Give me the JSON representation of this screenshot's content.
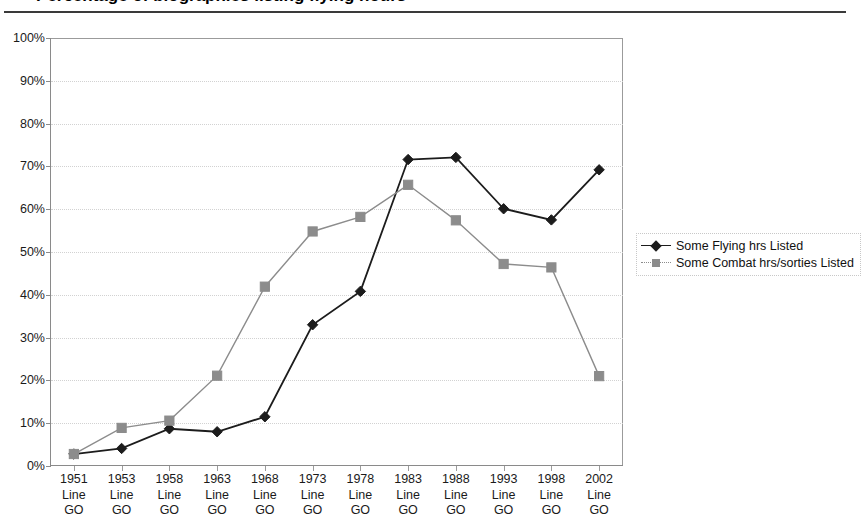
{
  "page": {
    "title_fragment": "Percentage of biographies listing flying hours",
    "background": "#ffffff"
  },
  "legend": {
    "position": "right",
    "items": [
      {
        "label": "Some Flying hrs Listed",
        "color": "#1c1c1c",
        "marker": "diamond"
      },
      {
        "label": "Some Combat hrs/sorties Listed",
        "color": "#8c8c8c",
        "marker": "square"
      }
    ]
  },
  "axis": {
    "y_ticks": [
      "0%",
      "10%",
      "20%",
      "30%",
      "40%",
      "50%",
      "60%",
      "70%",
      "80%",
      "90%",
      "100%"
    ],
    "x_sublabels": [
      "Line",
      "GO"
    ]
  },
  "chart_data": {
    "type": "line",
    "title": "Percentage of biographies listing flying hours",
    "xlabel": "",
    "ylabel": "",
    "ylim": [
      0,
      100
    ],
    "yticks": [
      0,
      10,
      20,
      30,
      40,
      50,
      60,
      70,
      80,
      90,
      100
    ],
    "ytick_labels": [
      "0%",
      "10%",
      "20%",
      "30%",
      "40%",
      "50%",
      "60%",
      "70%",
      "80%",
      "90%",
      "100%"
    ],
    "grid": true,
    "legend_position": "right",
    "categories": [
      "1951 Line GO",
      "1953 Line GO",
      "1958 Line GO",
      "1963 Line GO",
      "1968 Line GO",
      "1973 Line GO",
      "1978 Line GO",
      "1983 Line GO",
      "1988 Line GO",
      "1993 Line GO",
      "1998 Line GO",
      "2002 Line GO"
    ],
    "category_years": [
      "1951",
      "1953",
      "1958",
      "1963",
      "1968",
      "1973",
      "1978",
      "1983",
      "1988",
      "1993",
      "1998",
      "2002"
    ],
    "series": [
      {
        "name": "Some Flying hrs Listed",
        "color": "#1c1c1c",
        "marker": "diamond",
        "values": [
          2.8,
          4.1,
          8.7,
          8.0,
          11.5,
          33.0,
          40.8,
          71.6,
          72.1,
          60.1,
          57.5,
          69.2
        ]
      },
      {
        "name": "Some Combat hrs/sorties Listed",
        "color": "#8c8c8c",
        "marker": "square",
        "values": [
          2.8,
          8.9,
          10.6,
          21.1,
          41.9,
          54.8,
          58.2,
          65.7,
          57.4,
          47.2,
          46.4,
          21.0
        ]
      }
    ]
  }
}
